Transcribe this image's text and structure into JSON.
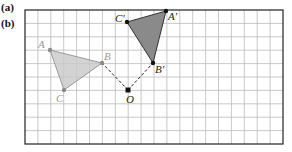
{
  "labels": {
    "a": "(a)",
    "b": "(b)"
  },
  "grid": {
    "x0": 25,
    "y0": 10,
    "cols": 20,
    "rows": 10,
    "cell": 12.9
  },
  "colors": {
    "original_fill": "#c8c8c8",
    "image_fill": "#8a8a8a",
    "original_point": "#8c8c8c",
    "image_point": "#111111"
  },
  "points": {
    "A": {
      "label": "A",
      "x": 50,
      "y": 50
    },
    "B": {
      "label": "B",
      "x": 102,
      "y": 63
    },
    "C": {
      "label": "C",
      "x": 64,
      "y": 90
    },
    "O": {
      "label": "O",
      "x": 128,
      "y": 90
    },
    "A_prime": {
      "label": "A'",
      "x": 166,
      "y": 11
    },
    "B_prime": {
      "label": "B'",
      "x": 153,
      "y": 63
    },
    "C_prime": {
      "label": "C'",
      "x": 127,
      "y": 22
    }
  }
}
